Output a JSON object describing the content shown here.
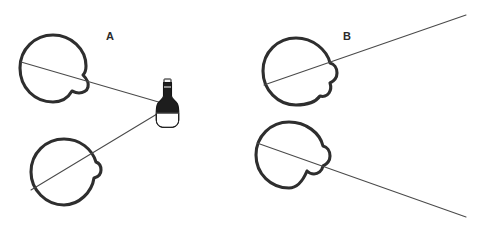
{
  "figure": {
    "background_color": "#ffffff",
    "width": 488,
    "height": 233,
    "outline_color": "#2e2e2e",
    "line_color": "#4a4a4a",
    "object_color": "#1d1d1d"
  },
  "panels": [
    {
      "id": "A",
      "label": "A",
      "label_x": 110,
      "label_y": 40,
      "description": "Both eyes converge on a near object (bottle)"
    },
    {
      "id": "B",
      "label": "B",
      "label_x": 347,
      "label_y": 40,
      "description": "Both eyes diverge toward a distant object off-frame"
    }
  ],
  "eyes": [
    {
      "name": "panel-a-upper-eye",
      "panel": "A",
      "position": "upper-left",
      "center_x": 53,
      "center_y": 68,
      "radius": 33
    },
    {
      "name": "panel-a-lower-eye",
      "panel": "A",
      "position": "lower-left",
      "center_x": 64,
      "center_y": 172,
      "radius": 33
    },
    {
      "name": "panel-b-upper-eye",
      "panel": "B",
      "position": "upper-left",
      "center_x": 296,
      "center_y": 71,
      "radius": 33
    },
    {
      "name": "panel-b-lower-eye",
      "panel": "B",
      "position": "lower-left",
      "center_x": 289,
      "center_y": 155,
      "radius": 33
    }
  ],
  "sight_lines": [
    {
      "name": "panel-a-upper-sight-line",
      "panel": "A",
      "from_x": 21,
      "from_y": 62,
      "to_x": 162,
      "to_y": 103
    },
    {
      "name": "panel-a-lower-sight-line",
      "panel": "A",
      "from_x": 31,
      "from_y": 190,
      "to_x": 162,
      "to_y": 111
    },
    {
      "name": "panel-b-upper-sight-line",
      "panel": "B",
      "from_x": 264,
      "from_y": 85,
      "to_x": 466,
      "to_y": 15
    },
    {
      "name": "panel-b-lower-sight-line",
      "panel": "B",
      "from_x": 257,
      "from_y": 143,
      "to_x": 466,
      "to_y": 217
    }
  ],
  "object": {
    "name": "bottle",
    "panel": "A",
    "x": 154,
    "y": 80,
    "width": 26,
    "height": 48,
    "label_text": ""
  }
}
